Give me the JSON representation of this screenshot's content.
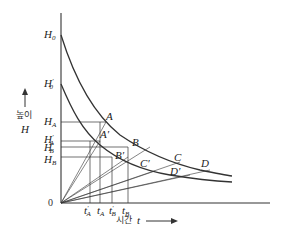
{
  "diagram": {
    "type": "decay-curves",
    "y_axis": {
      "label_korean": "높이",
      "label_var": "H",
      "arrow": "up"
    },
    "x_axis": {
      "label_korean": "시간",
      "label_var": "t",
      "arrow": "right"
    },
    "origin_label": "0",
    "y_labels": [
      {
        "base": "H",
        "sub": "0",
        "prime": ""
      },
      {
        "base": "H",
        "sub": "0",
        "prime": "′"
      },
      {
        "base": "H",
        "sub": "A",
        "prime": ""
      },
      {
        "base": "H",
        "sub": "A",
        "prime": "′"
      },
      {
        "base": "H",
        "sub": "B",
        "prime": "′"
      },
      {
        "base": "H",
        "sub": "B",
        "prime": ""
      }
    ],
    "x_labels": [
      {
        "base": "t",
        "sub": "A",
        "prime": "′"
      },
      {
        "base": "t",
        "sub": "A",
        "prime": ""
      },
      {
        "base": "t",
        "sub": "B",
        "prime": "′"
      },
      {
        "base": "t",
        "sub": "B",
        "prime": ""
      }
    ],
    "points": [
      {
        "name": "A",
        "curve": "upper"
      },
      {
        "name": "A′",
        "curve": "lower"
      },
      {
        "name": "B",
        "curve": "upper"
      },
      {
        "name": "B′",
        "curve": "lower"
      },
      {
        "name": "C",
        "curve": "upper"
      },
      {
        "name": "C′",
        "curve": "lower"
      },
      {
        "name": "D",
        "curve": "upper"
      },
      {
        "name": "D′",
        "curve": "lower"
      }
    ],
    "curves": [
      {
        "name": "upper-curve",
        "start": "H0"
      },
      {
        "name": "lower-curve",
        "start": "H0′"
      }
    ],
    "line_color": "#333333"
  }
}
